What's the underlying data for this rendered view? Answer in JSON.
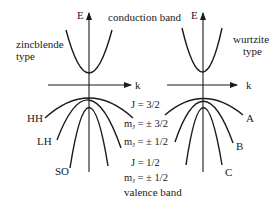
{
  "diagram": {
    "top_label": "conduction band",
    "bottom_label": "valence band",
    "left_panel": {
      "type_line1": "zincblende",
      "type_line2": "type",
      "energy_axis": "E",
      "k_axis": "k",
      "bands": {
        "hh": "HH",
        "lh": "LH",
        "so": "SO"
      }
    },
    "right_panel": {
      "type_line1": "wurtzite",
      "type_line2": "type",
      "energy_axis": "E",
      "k_axis": "k",
      "bands": {
        "a": "A",
        "b": "B",
        "c": "C"
      }
    },
    "quantum_numbers": {
      "j_32": "J = 3/2",
      "mj_32_m": "m",
      "mj_32_sub": "J",
      "mj_32_val": " = ± 3/2",
      "mj_12a_m": "m",
      "mj_12a_sub": "J",
      "mj_12a_val": " = ± 1/2",
      "j_12": "J = 1/2",
      "mj_12b_m": "m",
      "mj_12b_sub": "J",
      "mj_12b_val": " = ± 1/2"
    }
  }
}
